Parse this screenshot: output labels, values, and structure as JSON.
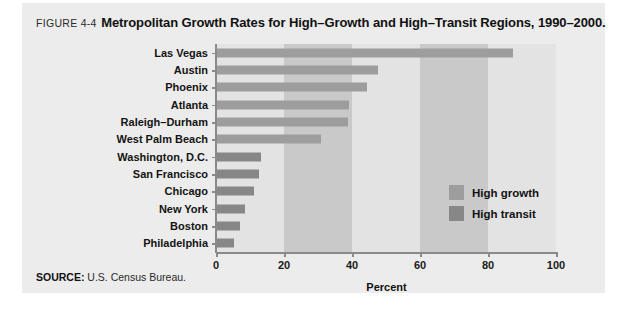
{
  "caption": {
    "figure_number": "FIGURE 4-4",
    "title": "Metropolitan Growth Rates for High–Growth and High–Transit Regions, 1990–2000."
  },
  "source": {
    "label": "SOURCE:",
    "text": " U.S. Census Bureau."
  },
  "legend": {
    "items": [
      {
        "label": "High growth",
        "color": "#9d9d9d"
      },
      {
        "label": "High transit",
        "color": "#878787"
      }
    ]
  },
  "colors": {
    "panel_background": "#ececec",
    "plot_background": "#e3e3e3",
    "band": "#c9c9c9",
    "axis": "#8a8a8a",
    "high_growth": "#9d9d9d",
    "high_transit": "#878787"
  },
  "chart_data": {
    "type": "bar",
    "orientation": "horizontal",
    "title": "Metropolitan Growth Rates for High–Growth and High–Transit Regions, 1990–2000.",
    "xlabel": "Percent",
    "ylabel": "",
    "xlim": [
      0,
      100
    ],
    "xticks": [
      0,
      20,
      40,
      60,
      80,
      100
    ],
    "xtick_labels": [
      "0",
      "20",
      "40",
      "60",
      "80",
      "100"
    ],
    "grid": false,
    "bands": [
      [
        20,
        40
      ],
      [
        60,
        80
      ]
    ],
    "legend_position": "inside-right",
    "categories": [
      "Las Vegas",
      "Austin",
      "Phoenix",
      "Atlanta",
      "Raleigh–Durham",
      "West Palm Beach",
      "Washington, D.C.",
      "San Francisco",
      "Chicago",
      "New York",
      "Boston",
      "Philadelphia"
    ],
    "series": [
      {
        "name": "High growth",
        "color": "#9d9d9d",
        "values": [
          87.4,
          47.6,
          44.4,
          39.2,
          38.8,
          31.0,
          null,
          null,
          null,
          null,
          null,
          null
        ]
      },
      {
        "name": "High transit",
        "color": "#878787",
        "values": [
          null,
          null,
          null,
          null,
          null,
          null,
          13.2,
          12.6,
          11.2,
          8.5,
          7.1,
          5.3
        ]
      }
    ],
    "values": [
      87.4,
      47.6,
      44.4,
      39.2,
      38.8,
      31.0,
      13.2,
      12.6,
      11.2,
      8.5,
      7.1,
      5.3
    ],
    "group_of": [
      "High growth",
      "High growth",
      "High growth",
      "High growth",
      "High growth",
      "High growth",
      "High transit",
      "High transit",
      "High transit",
      "High transit",
      "High transit",
      "High transit"
    ]
  }
}
